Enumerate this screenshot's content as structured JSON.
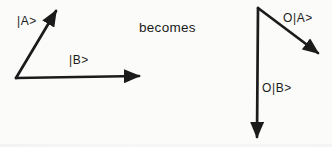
{
  "diagram": {
    "before": {
      "vector_a": {
        "label": "|A>"
      },
      "vector_b": {
        "label": "|B>"
      }
    },
    "transition": {
      "label": "becomes"
    },
    "after": {
      "vector_oa": {
        "label": "O|A>"
      },
      "vector_ob": {
        "label": "O|B>"
      }
    },
    "colors": {
      "ink": "#1b1b1b",
      "paper": "#fbfbfa"
    }
  }
}
